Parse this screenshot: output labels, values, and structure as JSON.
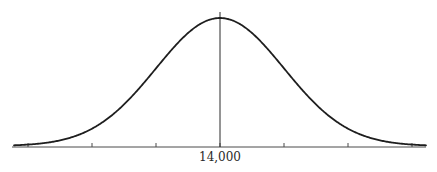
{
  "figure": {
    "type": "normal-distribution-curve",
    "mean_label": "14,000",
    "colors": {
      "curve": "#1e1e1e",
      "axis": "#4a4a4a",
      "background": "#ffffff"
    },
    "axis": {
      "x_start": 12,
      "x_end": 426,
      "baseline_y": 147
    },
    "mean_x": 220,
    "sigma_px": 64,
    "peak_y": 19,
    "mean_line_top_y": 12,
    "ticks_sigma": [
      -3,
      -2,
      -1,
      0,
      1,
      2,
      3
    ],
    "tick_height": 4
  }
}
